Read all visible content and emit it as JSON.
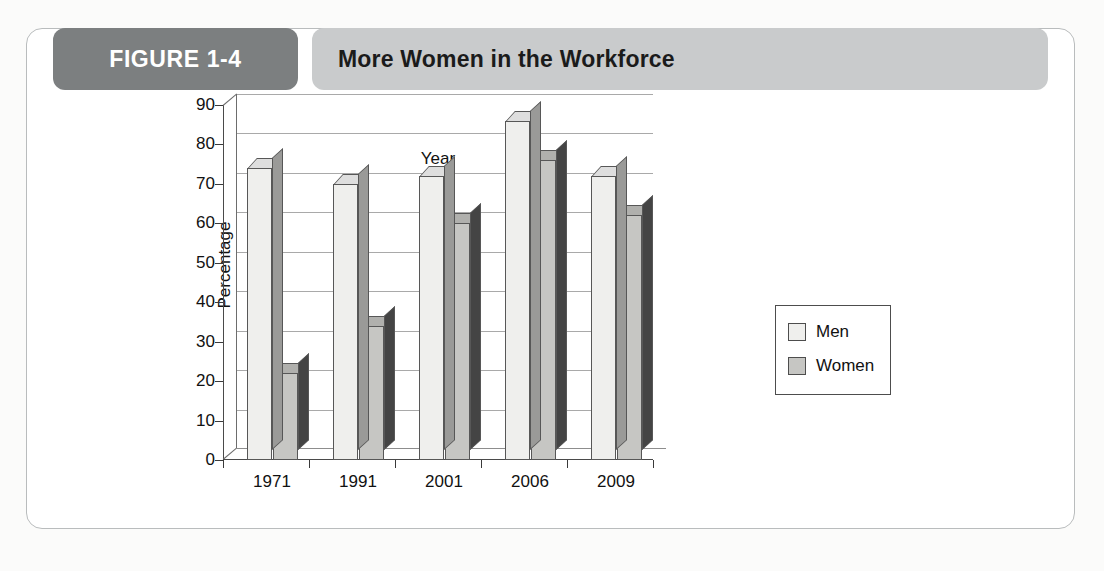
{
  "figure": {
    "tab_label": "FIGURE 1-4",
    "title": "More Women in the Workforce"
  },
  "legend": {
    "items": [
      {
        "label": "Men",
        "color": "#efefed"
      },
      {
        "label": "Women",
        "color": "#c6c6c3"
      }
    ]
  },
  "chart_data": {
    "type": "bar",
    "title": "More Women in the Workforce",
    "xlabel": "Year",
    "ylabel": "Percentage",
    "categories": [
      "1971",
      "1991",
      "2001",
      "2006",
      "2009"
    ],
    "series": [
      {
        "name": "Men",
        "values": [
          74,
          70,
          72,
          86,
          72
        ]
      },
      {
        "name": "Women",
        "values": [
          22,
          34,
          60,
          76,
          62
        ]
      }
    ],
    "ylim": [
      0,
      90
    ],
    "yticks": [
      0,
      10,
      20,
      30,
      40,
      50,
      60,
      70,
      80,
      90
    ],
    "ytick_labels": [
      "0",
      "10",
      "20",
      "30",
      "40",
      "50",
      "60",
      "70",
      "80",
      "90"
    ],
    "grid": true,
    "legend_position": "right"
  }
}
